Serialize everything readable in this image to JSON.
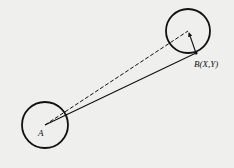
{
  "diagram": {
    "background": "#efefed",
    "stroke_color": "#111111",
    "circle_a": {
      "cx": 45,
      "cy": 125,
      "r": 23,
      "label": "A"
    },
    "circle_b": {
      "cx": 188,
      "cy": 31,
      "r": 22
    },
    "point_b": {
      "x": 196,
      "y": 53,
      "label": "B(X,Y)"
    },
    "lines": [
      {
        "type": "dashed",
        "from": "A",
        "to": "circle_b_center"
      },
      {
        "type": "solid",
        "from": "A",
        "to": "B"
      },
      {
        "type": "solid-arrow",
        "from": "circle_b_center",
        "to": "B"
      }
    ]
  }
}
